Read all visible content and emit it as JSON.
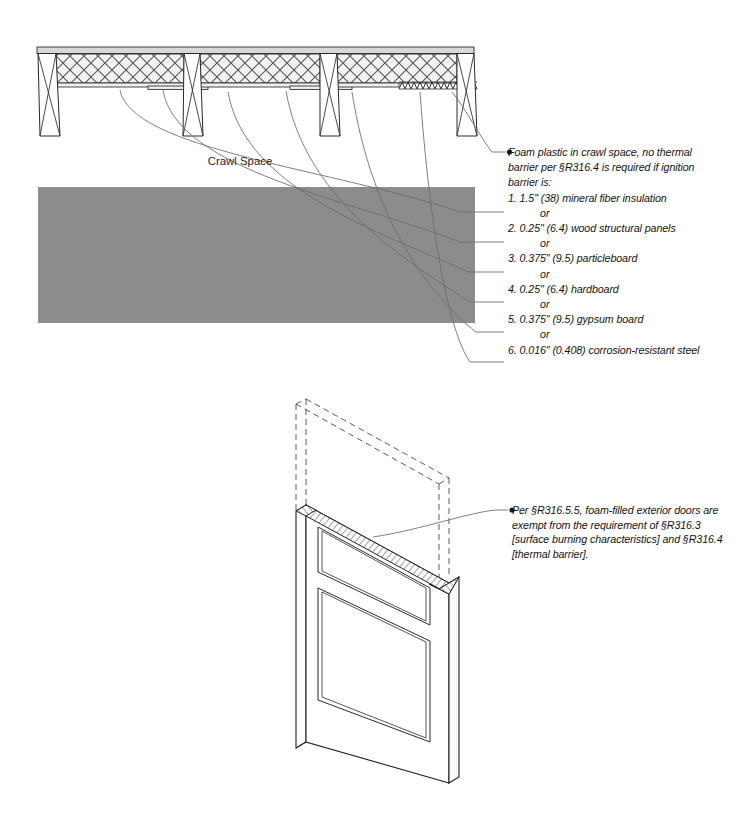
{
  "figure": {
    "title_labels": {
      "crawl_space": "Crawl Space"
    }
  },
  "annotations": {
    "crawl_space_note": {
      "bullet": "●",
      "intro_lines": [
        "Foam plastic in crawl space, no thermal",
        "barrier per §R316.4 is required if ignition",
        "barrier is:"
      ],
      "or_label": "or",
      "items": [
        "1.  1.5\" (38) mineral fiber insulation",
        "2. 0.25\" (6.4) wood structural panels",
        "3. 0.375\" (9.5) particleboard",
        "4. 0.25\" (6.4) hardboard",
        "5. 0.375\" (9.5) gypsum board",
        "6. 0.016\" (0.408) corrosion-resistant steel"
      ]
    },
    "door_note": {
      "bullet": "●",
      "lines": [
        "Per §R316.5.5, foam-filled exterior doors are",
        "exempt from the requirement of §R316.3",
        "[surface burning characteristics] and §R316.4",
        "[thermal barrier]."
      ]
    }
  },
  "colors": {
    "ground_fill": "#8c8c8c",
    "line": "#1f1f1f",
    "leader": "#5a5a5a",
    "hatch": "#444444",
    "paper": "#ffffff"
  }
}
